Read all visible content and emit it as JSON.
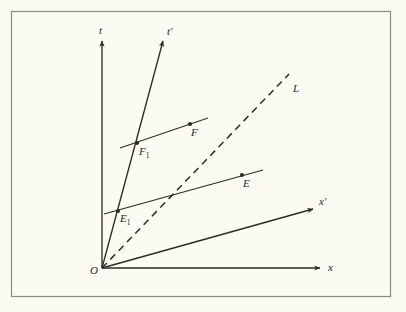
{
  "figure": {
    "kind": "minkowski-spacetime-diagram",
    "background_color": "#fbfaf3",
    "ink_color": "#2c2c22",
    "frame": {
      "x": 11,
      "y": 11,
      "width": 379,
      "height": 285,
      "stroke": "#8c8c78"
    },
    "origin": {
      "x": 102,
      "y": 268
    }
  },
  "labels": {
    "origin": "O",
    "t_axis": "t",
    "t_prime_axis": "t'",
    "x_axis": "x",
    "x_prime_axis": "x'",
    "light_line": "L",
    "event_e": "E",
    "event_e1_base": "E",
    "event_e1_sub": "1",
    "event_f": "F",
    "event_f1_base": "F",
    "event_f1_sub": "1"
  },
  "axes": [
    {
      "name": "t-axis",
      "label": "t",
      "style": "solid-arrow",
      "from": {
        "x": 102,
        "y": 268
      },
      "to": {
        "x": 102,
        "y": 41
      },
      "label_pos": {
        "x": 99,
        "y": 34
      }
    },
    {
      "name": "t-prime-axis",
      "label": "t'",
      "style": "solid-arrow",
      "from": {
        "x": 102,
        "y": 268
      },
      "to": {
        "x": 163,
        "y": 41
      },
      "label_pos": {
        "x": 167,
        "y": 35
      }
    },
    {
      "name": "x-axis",
      "label": "x",
      "style": "solid-arrow",
      "from": {
        "x": 102,
        "y": 268
      },
      "to": {
        "x": 320,
        "y": 268
      },
      "label_pos": {
        "x": 328,
        "y": 271
      }
    },
    {
      "name": "x-prime-axis",
      "label": "x'",
      "style": "solid-arrow",
      "from": {
        "x": 102,
        "y": 268
      },
      "to": {
        "x": 313,
        "y": 209
      },
      "label_pos": {
        "x": 319,
        "y": 205
      }
    },
    {
      "name": "light-line",
      "label": "L",
      "style": "dashed",
      "from": {
        "x": 102,
        "y": 268
      },
      "to": {
        "x": 289,
        "y": 74
      },
      "label_pos": {
        "x": 293,
        "y": 92
      }
    }
  ],
  "simultaneity_lines": [
    {
      "name": "line-through-F1-F",
      "from": {
        "x": 120,
        "y": 148
      },
      "to": {
        "x": 208,
        "y": 118
      }
    },
    {
      "name": "line-through-E1-E",
      "from": {
        "x": 104,
        "y": 214
      },
      "to": {
        "x": 263,
        "y": 170
      }
    }
  ],
  "events": [
    {
      "name": "event-F1",
      "label_base": "F",
      "label_sub": "1",
      "point": {
        "x": 137,
        "y": 143
      },
      "label_pos": {
        "x": 139,
        "y": 155
      }
    },
    {
      "name": "event-F",
      "label_base": "F",
      "label_sub": "",
      "point": {
        "x": 190,
        "y": 124
      },
      "label_pos": {
        "x": 191,
        "y": 136
      }
    },
    {
      "name": "event-E1",
      "label_base": "E",
      "label_sub": "1",
      "point": {
        "x": 118,
        "y": 211
      },
      "label_pos": {
        "x": 120,
        "y": 222
      }
    },
    {
      "name": "event-E",
      "label_base": "E",
      "label_sub": "",
      "point": {
        "x": 242,
        "y": 175
      },
      "label_pos": {
        "x": 243,
        "y": 187
      }
    }
  ]
}
